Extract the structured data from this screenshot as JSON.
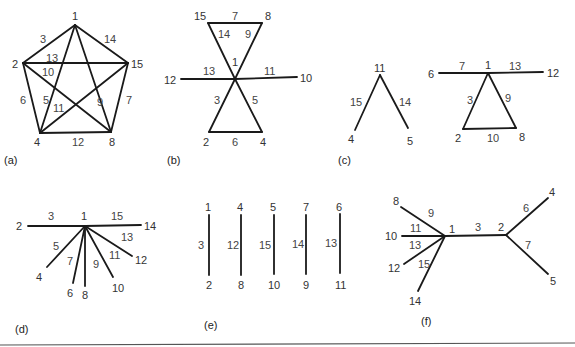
{
  "figure": {
    "background": "#ffffff",
    "line_color": "#1a1a1a",
    "text_color": "#333333",
    "panels": [
      {
        "id": "a",
        "caption": "(a)",
        "caption_pos": [
          4,
          164
        ],
        "vertices": [
          {
            "label": "1",
            "x": 75,
            "y": 25,
            "lx": 72,
            "ly": 20
          },
          {
            "label": "2",
            "x": 23,
            "y": 63,
            "lx": 12,
            "ly": 68
          },
          {
            "label": "15",
            "x": 128,
            "y": 63,
            "lx": 131,
            "ly": 68
          },
          {
            "label": "4",
            "x": 40,
            "y": 133,
            "lx": 34,
            "ly": 146
          },
          {
            "label": "8",
            "x": 111,
            "y": 132,
            "lx": 109,
            "ly": 146
          }
        ],
        "edges": [
          {
            "label": "3",
            "from": [
              75,
              25
            ],
            "to": [
              23,
              63
            ],
            "lx": 40,
            "ly": 43
          },
          {
            "label": "14",
            "from": [
              75,
              25
            ],
            "to": [
              128,
              63
            ],
            "lx": 104,
            "ly": 43
          },
          {
            "label": "13",
            "from": [
              23,
              63
            ],
            "to": [
              128,
              63
            ],
            "lx": 46,
            "ly": 62
          },
          {
            "label": "10",
            "from": [
              23,
              63
            ],
            "to": [
              111,
              132
            ],
            "lx": 42,
            "ly": 76
          },
          {
            "label": "6",
            "from": [
              23,
              63
            ],
            "to": [
              40,
              133
            ],
            "lx": 20,
            "ly": 104
          },
          {
            "label": "5",
            "from": [
              75,
              25
            ],
            "to": [
              40,
              133
            ],
            "lx": 43,
            "ly": 104
          },
          {
            "label": "9",
            "from": [
              75,
              25
            ],
            "to": [
              111,
              132
            ],
            "lx": 97,
            "ly": 106
          },
          {
            "label": "11",
            "from": [
              128,
              63
            ],
            "to": [
              40,
              133
            ],
            "lx": 53,
            "ly": 112
          },
          {
            "label": "7",
            "from": [
              128,
              63
            ],
            "to": [
              111,
              132
            ],
            "lx": 126,
            "ly": 104
          },
          {
            "label": "12",
            "from": [
              40,
              133
            ],
            "to": [
              111,
              132
            ],
            "lx": 72,
            "ly": 146
          }
        ]
      },
      {
        "id": "b",
        "caption": "(b)",
        "caption_pos": [
          167,
          164
        ],
        "vertices": [
          {
            "label": "15",
            "x": 208,
            "y": 23,
            "lx": 194,
            "ly": 20
          },
          {
            "label": "8",
            "x": 262,
            "y": 23,
            "lx": 265,
            "ly": 20
          },
          {
            "label": "1",
            "x": 235,
            "y": 79,
            "lx": 232,
            "ly": 66
          },
          {
            "label": "12",
            "x": 181,
            "y": 79,
            "lx": 164,
            "ly": 84
          },
          {
            "label": "10",
            "x": 297,
            "y": 77,
            "lx": 300,
            "ly": 82
          },
          {
            "label": "2",
            "x": 209,
            "y": 132,
            "lx": 203,
            "ly": 146
          },
          {
            "label": "4",
            "x": 262,
            "y": 132,
            "lx": 260,
            "ly": 146
          }
        ],
        "edges": [
          {
            "label": "7",
            "from": [
              208,
              23
            ],
            "to": [
              262,
              23
            ],
            "lx": 232,
            "ly": 20
          },
          {
            "label": "14",
            "from": [
              208,
              23
            ],
            "to": [
              235,
              79
            ],
            "lx": 218,
            "ly": 38
          },
          {
            "label": "9",
            "from": [
              262,
              23
            ],
            "to": [
              235,
              79
            ],
            "lx": 245,
            "ly": 38
          },
          {
            "label": "13",
            "from": [
              181,
              79
            ],
            "to": [
              235,
              79
            ],
            "lx": 203,
            "ly": 75
          },
          {
            "label": "11",
            "from": [
              235,
              79
            ],
            "to": [
              297,
              77
            ],
            "lx": 264,
            "ly": 75
          },
          {
            "label": "3",
            "from": [
              235,
              79
            ],
            "to": [
              209,
              132
            ],
            "lx": 214,
            "ly": 104
          },
          {
            "label": "5",
            "from": [
              235,
              79
            ],
            "to": [
              262,
              132
            ],
            "lx": 252,
            "ly": 104
          },
          {
            "label": "6",
            "from": [
              209,
              132
            ],
            "to": [
              262,
              132
            ],
            "lx": 232,
            "ly": 146
          }
        ]
      },
      {
        "id": "c",
        "caption": "(c)",
        "caption_pos": [
          338,
          164
        ],
        "vertices": [
          {
            "label": "11",
            "x": 380,
            "y": 75,
            "lx": 374,
            "ly": 72
          },
          {
            "label": "4",
            "x": 355,
            "y": 130,
            "lx": 348,
            "ly": 143
          },
          {
            "label": "5",
            "x": 408,
            "y": 128,
            "lx": 407,
            "ly": 145
          },
          {
            "label": "6",
            "x": 439,
            "y": 73,
            "lx": 428,
            "ly": 78
          },
          {
            "label": "1",
            "x": 488,
            "y": 73,
            "lx": 485,
            "ly": 69
          },
          {
            "label": "12",
            "x": 543,
            "y": 72,
            "lx": 547,
            "ly": 77
          },
          {
            "label": "2",
            "x": 463,
            "y": 129,
            "lx": 455,
            "ly": 142
          },
          {
            "label": "8",
            "x": 516,
            "y": 128,
            "lx": 519,
            "ly": 141
          }
        ],
        "edges": [
          {
            "label": "15",
            "from": [
              380,
              75
            ],
            "to": [
              355,
              130
            ],
            "lx": 350,
            "ly": 106
          },
          {
            "label": "14",
            "from": [
              380,
              75
            ],
            "to": [
              408,
              128
            ],
            "lx": 399,
            "ly": 106
          },
          {
            "label": "7",
            "from": [
              439,
              73
            ],
            "to": [
              488,
              73
            ],
            "lx": 459,
            "ly": 70
          },
          {
            "label": "13",
            "from": [
              488,
              73
            ],
            "to": [
              543,
              72
            ],
            "lx": 509,
            "ly": 70
          },
          {
            "label": "3",
            "from": [
              488,
              73
            ],
            "to": [
              463,
              129
            ],
            "lx": 467,
            "ly": 104
          },
          {
            "label": "9",
            "from": [
              488,
              73
            ],
            "to": [
              516,
              128
            ],
            "lx": 505,
            "ly": 102
          },
          {
            "label": "10",
            "from": [
              463,
              129
            ],
            "to": [
              516,
              128
            ],
            "lx": 487,
            "ly": 142
          }
        ]
      },
      {
        "id": "d",
        "caption": "(d)",
        "caption_pos": [
          15,
          333
        ],
        "vertices": [
          {
            "label": "1",
            "x": 85,
            "y": 226,
            "lx": 81,
            "ly": 220
          },
          {
            "label": "2",
            "x": 28,
            "y": 226,
            "lx": 16,
            "ly": 230
          },
          {
            "label": "14",
            "x": 141,
            "y": 225,
            "lx": 144,
            "ly": 230
          },
          {
            "label": "4",
            "x": 47,
            "y": 267,
            "lx": 36,
            "ly": 281
          },
          {
            "label": "6",
            "x": 73,
            "y": 283,
            "lx": 67,
            "ly": 297
          },
          {
            "label": "8",
            "x": 85,
            "y": 286,
            "lx": 82,
            "ly": 299
          },
          {
            "label": "10",
            "x": 113,
            "y": 277,
            "lx": 112,
            "ly": 292
          },
          {
            "label": "12",
            "x": 132,
            "y": 256,
            "lx": 135,
            "ly": 264
          }
        ],
        "edges": [
          {
            "label": "3",
            "from": [
              28,
              226
            ],
            "to": [
              85,
              226
            ],
            "lx": 48,
            "ly": 220
          },
          {
            "label": "15",
            "from": [
              85,
              226
            ],
            "to": [
              141,
              225
            ],
            "lx": 111,
            "ly": 220
          },
          {
            "label": "5",
            "from": [
              85,
              226
            ],
            "to": [
              47,
              267
            ],
            "lx": 53,
            "ly": 250
          },
          {
            "label": "7",
            "from": [
              85,
              226
            ],
            "to": [
              73,
              283
            ],
            "lx": 67,
            "ly": 265
          },
          {
            "label": "9",
            "from": [
              85,
              226
            ],
            "to": [
              85,
              286
            ],
            "lx": 93,
            "ly": 268
          },
          {
            "label": "11",
            "from": [
              85,
              226
            ],
            "to": [
              113,
              277
            ],
            "lx": 109,
            "ly": 259
          },
          {
            "label": "13",
            "from": [
              85,
              226
            ],
            "to": [
              132,
              256
            ],
            "lx": 121,
            "ly": 241
          }
        ]
      },
      {
        "id": "e",
        "caption": "(e)",
        "caption_pos": [
          204,
          329
        ],
        "vertices": [
          {
            "label": "1",
            "x": 209,
            "y": 215,
            "lx": 205,
            "ly": 211
          },
          {
            "label": "2",
            "x": 209,
            "y": 275,
            "lx": 206,
            "ly": 289
          },
          {
            "label": "4",
            "x": 241,
            "y": 215,
            "lx": 237,
            "ly": 211
          },
          {
            "label": "8",
            "x": 241,
            "y": 275,
            "lx": 238,
            "ly": 289
          },
          {
            "label": "5",
            "x": 274,
            "y": 215,
            "lx": 270,
            "ly": 211
          },
          {
            "label": "10",
            "x": 274,
            "y": 274,
            "lx": 268,
            "ly": 289
          },
          {
            "label": "7",
            "x": 306,
            "y": 215,
            "lx": 303,
            "ly": 211
          },
          {
            "label": "9",
            "x": 306,
            "y": 274,
            "lx": 303,
            "ly": 289
          },
          {
            "label": "6",
            "x": 340,
            "y": 214,
            "lx": 336,
            "ly": 211
          },
          {
            "label": "11",
            "x": 340,
            "y": 273,
            "lx": 335,
            "ly": 289
          }
        ],
        "edges": [
          {
            "label": "3",
            "from": [
              209,
              215
            ],
            "to": [
              209,
              275
            ],
            "lx": 198,
            "ly": 249
          },
          {
            "label": "12",
            "from": [
              241,
              215
            ],
            "to": [
              241,
              275
            ],
            "lx": 227,
            "ly": 249
          },
          {
            "label": "15",
            "from": [
              274,
              215
            ],
            "to": [
              274,
              274
            ],
            "lx": 259,
            "ly": 249
          },
          {
            "label": "14",
            "from": [
              306,
              215
            ],
            "to": [
              306,
              274
            ],
            "lx": 292,
            "ly": 248
          },
          {
            "label": "13",
            "from": [
              340,
              214
            ],
            "to": [
              340,
              273
            ],
            "lx": 325,
            "ly": 247
          }
        ]
      },
      {
        "id": "f",
        "caption": "(f)",
        "caption_pos": [
          421,
          325
        ],
        "vertices": [
          {
            "label": "8",
            "x": 401,
            "y": 207,
            "lx": 393,
            "ly": 205
          },
          {
            "label": "10",
            "x": 402,
            "y": 236,
            "lx": 385,
            "ly": 240
          },
          {
            "label": "12",
            "x": 404,
            "y": 264,
            "lx": 388,
            "ly": 272
          },
          {
            "label": "14",
            "x": 418,
            "y": 291,
            "lx": 409,
            "ly": 305
          },
          {
            "label": "1",
            "x": 445,
            "y": 236,
            "lx": 449,
            "ly": 233
          },
          {
            "label": "2",
            "x": 506,
            "y": 235,
            "lx": 498,
            "ly": 231
          },
          {
            "label": "4",
            "x": 548,
            "y": 198,
            "lx": 549,
            "ly": 196
          },
          {
            "label": "5",
            "x": 548,
            "y": 274,
            "lx": 550,
            "ly": 285
          }
        ],
        "edges": [
          {
            "label": "9",
            "from": [
              401,
              207
            ],
            "to": [
              445,
              236
            ],
            "lx": 428,
            "ly": 217
          },
          {
            "label": "11",
            "from": [
              402,
              236
            ],
            "to": [
              445,
              236
            ],
            "lx": 410,
            "ly": 232
          },
          {
            "label": "13",
            "from": [
              404,
              264
            ],
            "to": [
              445,
              236
            ],
            "lx": 409,
            "ly": 249
          },
          {
            "label": "15",
            "from": [
              418,
              291
            ],
            "to": [
              445,
              236
            ],
            "lx": 418,
            "ly": 268
          },
          {
            "label": "3",
            "from": [
              445,
              236
            ],
            "to": [
              506,
              235
            ],
            "lx": 475,
            "ly": 231
          },
          {
            "label": "6",
            "from": [
              506,
              235
            ],
            "to": [
              548,
              198
            ],
            "lx": 523,
            "ly": 212
          },
          {
            "label": "7",
            "from": [
              506,
              235
            ],
            "to": [
              548,
              274
            ],
            "lx": 525,
            "ly": 249
          }
        ]
      }
    ],
    "bottom_rule": {
      "x1": 0,
      "y1": 345,
      "x2": 575,
      "y2": 343
    }
  }
}
